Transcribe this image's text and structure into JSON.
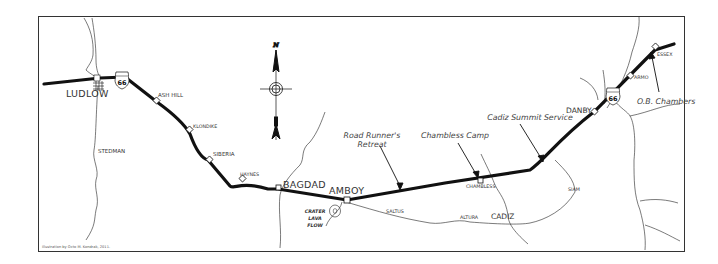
{
  "map": {
    "title": "Route 66 map: Ludlow to Essex",
    "route_shield": "66",
    "compass_letter": "N",
    "credit": "Illustration by Octo M. Kondrak, 2011.",
    "towns_major": [
      "LUDLOW",
      "BAGDAD",
      "AMBOY",
      "CADIZ",
      "DANBY"
    ],
    "towns_minor": [
      "ASH HILL",
      "STEDMAN",
      "SIBERIA",
      "KLONDIKE",
      "HAYNES",
      "SALTUS",
      "ALTURA",
      "CHAMBLESS",
      "SIAM",
      "ARMO",
      "ESSEX"
    ],
    "landmark": [
      "CRATER",
      "LAVA",
      "FLOW"
    ],
    "businesses": {
      "road_runner_1": "Road Runner's",
      "road_runner_2": "Retreat",
      "chambless_camp": "Chambless Camp",
      "cadiz_summit": "Cadiz Summit Service",
      "ob_chambers": "O.B. Chambers"
    },
    "colors": {
      "road": "#111111",
      "line": "#222222",
      "text": "#333333"
    }
  }
}
